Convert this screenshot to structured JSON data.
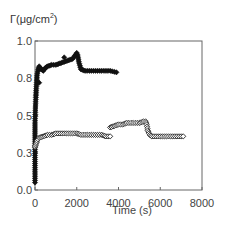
{
  "chart_data": {
    "type": "scatter",
    "title": "",
    "ylabel": "Γ(μg/cm²)",
    "ylabel_parts": {
      "main": "Γ(μg/cm",
      "sup": "2",
      "close": ")"
    },
    "xlabel": "Time (s)",
    "xlim": [
      0,
      8000
    ],
    "ylim": [
      0,
      1.0
    ],
    "x_ticks": [
      0,
      2000,
      4000,
      6000,
      8000
    ],
    "x_tick_labels": [
      "0",
      "2000",
      "4000",
      "6000",
      "8000"
    ],
    "y_ticks": [
      0,
      0.25,
      0.5,
      0.75,
      1.0
    ],
    "y_tick_labels": [
      "0.0",
      "0.3",
      "0.5",
      "0.8",
      "1.0"
    ],
    "grid": false,
    "legend": null,
    "series": [
      {
        "name": "filled diamonds (upper)",
        "marker": "filled-diamond",
        "color": "#111111",
        "x": [
          0,
          0,
          0,
          0,
          20,
          40,
          60,
          80,
          100,
          150,
          200,
          300,
          400,
          500,
          600,
          800,
          1000,
          1200,
          1400,
          1600,
          1800,
          1900,
          2000,
          2050,
          2100,
          2200,
          2400,
          2800,
          3200,
          3600,
          3900
        ],
        "y": [
          0.05,
          0.15,
          0.3,
          0.45,
          0.55,
          0.62,
          0.68,
          0.72,
          0.77,
          0.81,
          0.83,
          0.81,
          0.8,
          0.82,
          0.83,
          0.84,
          0.84,
          0.85,
          0.86,
          0.87,
          0.88,
          0.9,
          0.92,
          0.9,
          0.86,
          0.81,
          0.8,
          0.8,
          0.8,
          0.8,
          0.79
        ]
      },
      {
        "name": "filled diamond outliers",
        "marker": "filled-diamond",
        "color": "#111111",
        "x": [
          1400,
          200
        ],
        "y": [
          0.89,
          0.72
        ]
      },
      {
        "name": "open diamonds (lower, run 1)",
        "marker": "open-diamond",
        "color": "#222222",
        "x": [
          0,
          50,
          100,
          200,
          400,
          600,
          800,
          1000,
          1200,
          1400,
          1600,
          1800,
          2000,
          2200,
          2400,
          2600,
          2800,
          3000,
          3200,
          3400,
          3600
        ],
        "y": [
          0.29,
          0.31,
          0.33,
          0.35,
          0.36,
          0.37,
          0.37,
          0.38,
          0.38,
          0.38,
          0.38,
          0.38,
          0.38,
          0.37,
          0.37,
          0.37,
          0.37,
          0.37,
          0.37,
          0.36,
          0.36
        ]
      },
      {
        "name": "open diamonds (lower, run 2)",
        "marker": "open-diamond",
        "color": "#222222",
        "x": [
          3600,
          3800,
          4000,
          4200,
          4400,
          4600,
          4800,
          5000,
          5200,
          5300,
          5350,
          5400,
          5500,
          5600,
          5800,
          6000,
          6200,
          6400,
          6600,
          6800,
          7000,
          7100
        ],
        "y": [
          0.42,
          0.43,
          0.44,
          0.44,
          0.45,
          0.45,
          0.45,
          0.45,
          0.46,
          0.46,
          0.44,
          0.4,
          0.37,
          0.36,
          0.36,
          0.36,
          0.36,
          0.36,
          0.36,
          0.36,
          0.36,
          0.36
        ]
      }
    ],
    "plot_area_px": {
      "left": 35,
      "top": 41,
      "right": 202,
      "bottom": 190
    }
  }
}
